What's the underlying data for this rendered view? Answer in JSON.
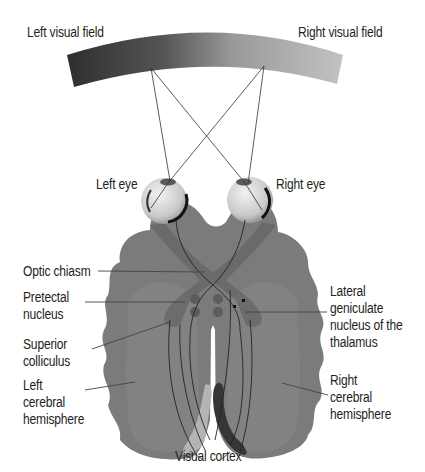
{
  "labels": {
    "left_visual_field": "Left visual field",
    "right_visual_field": "Right visual field",
    "left_eye": "Left eye",
    "right_eye": "Right eye",
    "optic_chiasm": "Optic chiasm",
    "pretectal_nucleus": "Pretectal\nnucleus",
    "superior_colliculus": "Superior\ncolliculus",
    "left_hemisphere": "Left\ncerebral\nhemisphere",
    "lgn": "Lateral\ngeniculate\nnucleus of the\nthalamus",
    "right_hemisphere": "Right\ncerebral\nhemisphere",
    "visual_cortex": "Visual cortex"
  },
  "colors": {
    "field_dark": "#2f2f2f",
    "field_light": "#b8b8b8",
    "brain": "#7a7a7a",
    "brain_inner": "#868686",
    "tract": "#5e5e5e",
    "nuclei": "#5a5a5a",
    "cortex_left": "#b0b0b0",
    "cortex_right": "#3a3a3a",
    "line": "#231f20"
  }
}
